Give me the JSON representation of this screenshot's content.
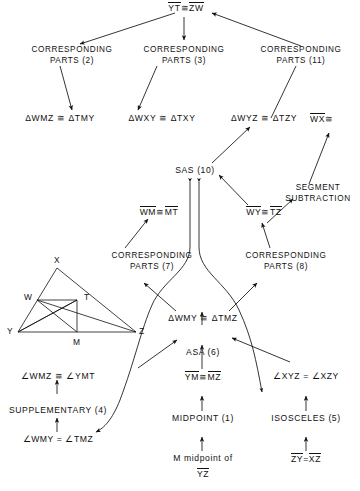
{
  "nodes": {
    "top_goal": {
      "a": "YT",
      "rel": "≅",
      "b": "ZW"
    },
    "corr2": {
      "line1": "CORRESPONDING",
      "line2": "PARTS (2)"
    },
    "corr3": {
      "line1": "CORRESPONDING",
      "line2": "PARTS (3)"
    },
    "corr11": {
      "line1": "CORRESPONDING",
      "line2": "PARTS (11)"
    },
    "tri_wmz": {
      "text": "ΔWMZ ≅ ΔTMY"
    },
    "tri_wxy": {
      "text": "ΔWXY ≅ ΔTXY"
    },
    "tri_wyz": {
      "text": "ΔWYZ ≅ ΔTZY"
    },
    "wx_partial": {
      "a": "WX",
      "rel": "≅"
    },
    "sas10": {
      "text": "SAS (10)"
    },
    "segsub": {
      "line1": "SEGMENT",
      "line2": "SUBTRACTION"
    },
    "wm_mt": {
      "a": "WM",
      "rel": "≅",
      "b": "MT"
    },
    "wy_tz": {
      "a": "WY",
      "rel": "≅",
      "b": "TZ"
    },
    "corr7": {
      "line1": "CORRESPONDING",
      "line2": "PARTS (7)"
    },
    "corr8": {
      "line1": "CORRESPONDING",
      "line2": "PARTS (8)"
    },
    "tri_wmy": {
      "text": "ΔWMY ≅ ΔTMZ"
    },
    "asa6": {
      "text": "ASA (6)"
    },
    "ym_mz": {
      "a": "YM",
      "rel": "≅",
      "b": "MZ"
    },
    "ang_xyz": {
      "text": "∠XYZ = ∠XZY"
    },
    "ang_wmz": {
      "text": "∠WMZ ≅ ∠YMT"
    },
    "supplementary4": {
      "text": "SUPPLEMENTARY (4)"
    },
    "ang_wmy": {
      "text": "∠WMY = ∠TMZ"
    },
    "midpoint1": {
      "text": "MIDPOINT (1)"
    },
    "isosceles5": {
      "text": "ISOSCELES (5)"
    },
    "given_mid": {
      "line1": "M midpoint of",
      "line2": "YZ"
    },
    "zy_xz": {
      "a": "ZY",
      "rel": "=",
      "b": "XZ"
    }
  },
  "figure": {
    "name": "triangle-diagram",
    "vertices": [
      {
        "label": "X"
      },
      {
        "label": "W"
      },
      {
        "label": "T"
      },
      {
        "label": "Y"
      },
      {
        "label": "Z"
      },
      {
        "label": "M"
      }
    ]
  },
  "colors": {
    "ink": "#111111",
    "background": "#ffffff"
  }
}
